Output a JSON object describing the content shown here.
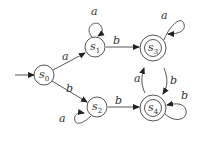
{
  "diagram": {
    "type": "finite-automaton",
    "states": [
      {
        "id": "s0",
        "name": "s",
        "sub": "0",
        "cx": 44,
        "cy": 75,
        "accepting": false,
        "start": true
      },
      {
        "id": "s1",
        "name": "s",
        "sub": "1",
        "cx": 95,
        "cy": 47,
        "accepting": false,
        "start": false
      },
      {
        "id": "s2",
        "name": "s",
        "sub": "2",
        "cx": 97,
        "cy": 107,
        "accepting": false,
        "start": false
      },
      {
        "id": "s3",
        "name": "s",
        "sub": "3",
        "cx": 153,
        "cy": 48,
        "accepting": true,
        "start": false
      },
      {
        "id": "s4",
        "name": "s",
        "sub": "4",
        "cx": 153,
        "cy": 108,
        "accepting": true,
        "start": false
      }
    ],
    "transitions": [
      {
        "from": "s0",
        "to": "s1",
        "label": "a"
      },
      {
        "from": "s0",
        "to": "s2",
        "label": "b"
      },
      {
        "from": "s1",
        "to": "s1",
        "label": "a"
      },
      {
        "from": "s1",
        "to": "s3",
        "label": "b"
      },
      {
        "from": "s2",
        "to": "s2",
        "label": "a"
      },
      {
        "from": "s2",
        "to": "s4",
        "label": "b"
      },
      {
        "from": "s3",
        "to": "s3",
        "label": "a"
      },
      {
        "from": "s3",
        "to": "s4",
        "label": "b"
      },
      {
        "from": "s4",
        "to": "s3",
        "label": "a"
      },
      {
        "from": "s4",
        "to": "s4",
        "label": "b"
      }
    ],
    "labels": {
      "s0_name": "s",
      "s0_sub": "0",
      "s1_name": "s",
      "s1_sub": "1",
      "s2_name": "s",
      "s2_sub": "2",
      "s3_name": "s",
      "s3_sub": "3",
      "s4_name": "s",
      "s4_sub": "4",
      "e_s0_s1": "a",
      "e_s0_s2": "b",
      "e_s1_s1": "a",
      "e_s1_s3": "b",
      "e_s2_s2": "a",
      "e_s2_s4": "b",
      "e_s3_s3": "a",
      "e_s3_s4": "b",
      "e_s4_s3": "a",
      "e_s4_s4": "b"
    }
  }
}
